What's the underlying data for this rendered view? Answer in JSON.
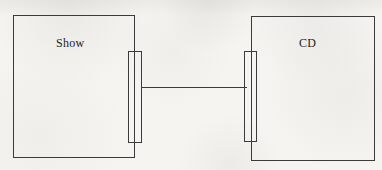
{
  "diagram": {
    "type": "component-connector-diagram",
    "components": [
      {
        "id": "show",
        "label": "Show"
      },
      {
        "id": "cd",
        "label": "CD"
      }
    ],
    "connectors": [
      {
        "from": "show",
        "to": "cd",
        "style": "solid-line"
      }
    ],
    "colors": {
      "line": "#3b3b3b",
      "label_text": "#1e1e1e",
      "paper_background": "#f5f4f1"
    }
  }
}
